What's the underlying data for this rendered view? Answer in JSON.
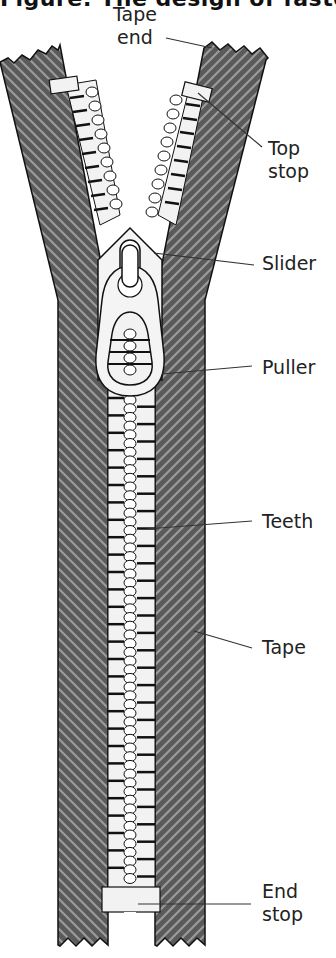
{
  "title": "Figure: The design of fastening",
  "labels": {
    "tape_end": [
      "Tape",
      "end"
    ],
    "top_stop": [
      "Top",
      "stop"
    ],
    "slider": "Slider",
    "puller": "Puller",
    "teeth": "Teeth",
    "tape": "Tape",
    "end_stop": [
      "End",
      "stop"
    ]
  },
  "colors": {
    "tape": "#5a5a5a",
    "tape_stripe": "#9a9a9a",
    "teeth": "#f2f2f2",
    "outline": "#111111",
    "leader": "#333333"
  }
}
